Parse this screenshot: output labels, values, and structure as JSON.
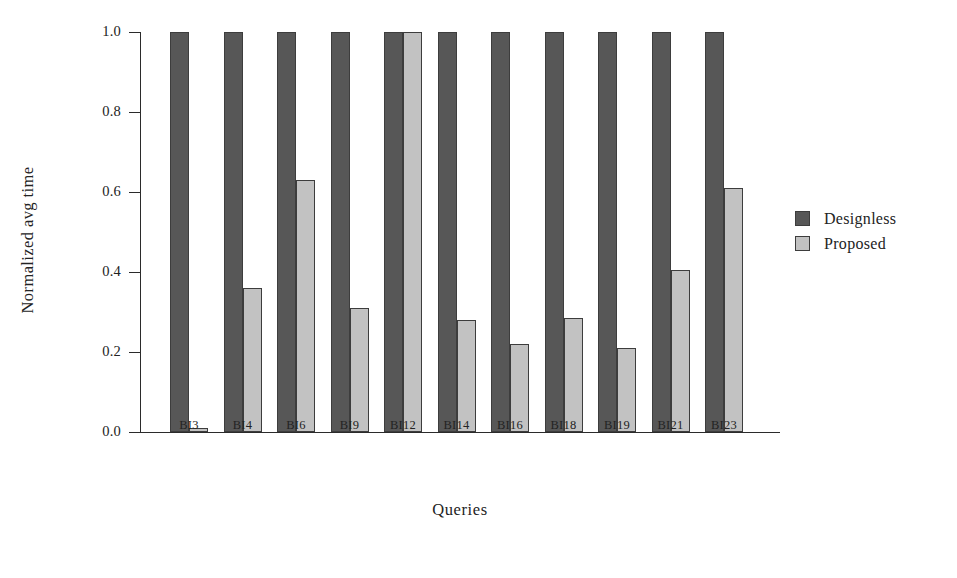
{
  "chart_data": {
    "type": "bar",
    "title": "",
    "xlabel": "Queries",
    "ylabel": "Normalized avg time",
    "ylim": [
      0.0,
      1.0
    ],
    "ytick_labels": [
      "1.0",
      "0.8",
      "0.6",
      "0.4",
      "0.2",
      "0.0"
    ],
    "ytick_values": [
      1.0,
      0.8,
      0.6,
      0.4,
      0.2,
      0.0
    ],
    "grid": false,
    "legend_position": "right",
    "categories": [
      "BI3",
      "BI4",
      "BI6",
      "BI9",
      "BI12",
      "BI14",
      "BI16",
      "BI18",
      "BI19",
      "BI21",
      "BI23"
    ],
    "series": [
      {
        "name": "Designless",
        "color": "#575757",
        "values": [
          1.0,
          1.0,
          1.0,
          1.0,
          1.0,
          1.0,
          1.0,
          1.0,
          1.0,
          1.0,
          1.0
        ]
      },
      {
        "name": "Proposed",
        "color": "#c2c2c2",
        "values": [
          0.01,
          0.36,
          0.63,
          0.31,
          1.0,
          0.28,
          0.22,
          0.285,
          0.21,
          0.405,
          0.61
        ]
      }
    ]
  },
  "legend": {
    "entries": [
      {
        "label": "Designless",
        "color": "#575757"
      },
      {
        "label": "Proposed",
        "color": "#c2c2c2"
      }
    ]
  },
  "axes": {
    "y_title": "Normalized avg time",
    "x_title": "Queries"
  },
  "colors": {
    "designless": "#575757",
    "proposed": "#c2c2c2",
    "axis": "#2b2b2b",
    "bar_border": "#3d3d3d",
    "background": "#ffffff"
  }
}
